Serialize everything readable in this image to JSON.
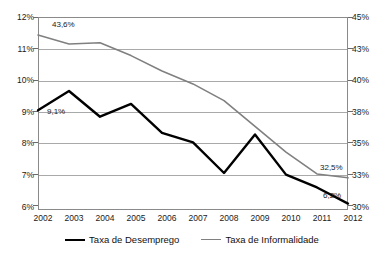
{
  "chart_data": {
    "type": "line",
    "title": "",
    "subtitle": "",
    "xlabel": "",
    "ylabel": "",
    "grid": true,
    "legend_position": "bottom",
    "categories": [
      "2002",
      "2003",
      "2004",
      "2005",
      "2006",
      "2007",
      "2008",
      "2009",
      "2010",
      "2011",
      "2012"
    ],
    "axes": {
      "left": {
        "name": "Taxa de Desemprego",
        "ticks": [
          "12%",
          "11%",
          "10%",
          "9%",
          "8%",
          "7%",
          "6%"
        ],
        "tick_values": [
          12,
          11,
          10,
          9,
          8,
          7,
          6
        ],
        "ylim": [
          6,
          12
        ],
        "unit": "%"
      },
      "right": {
        "name": "Taxa de Informalidade",
        "ticks": [
          "45%",
          "43%",
          "40%",
          "38%",
          "35%",
          "33%",
          "30%"
        ],
        "tick_values": [
          45,
          42.5,
          40,
          37.5,
          35,
          32.5,
          30
        ],
        "ylim": [
          30,
          45
        ],
        "unit": "%"
      }
    },
    "series": [
      {
        "name": "Taxa de Desemprego",
        "axis": "left",
        "color": "#000000",
        "line_width": 2.4,
        "values": [
          9.1,
          9.7,
          8.9,
          9.3,
          8.4,
          8.1,
          7.15,
          8.35,
          7.1,
          6.7,
          6.2
        ]
      },
      {
        "name": "Taxa de Informalidade",
        "axis": "right",
        "color": "#808080",
        "line_width": 1.6,
        "values": [
          43.6,
          42.9,
          43.0,
          42.0,
          40.8,
          39.8,
          38.5,
          36.5,
          34.5,
          32.8,
          32.5
        ]
      }
    ],
    "annotations": [
      {
        "text": "43,6%",
        "series": "Taxa de Informalidade",
        "category": "2002",
        "value": 43.6
      },
      {
        "text": "9,1%",
        "series": "Taxa de Desemprego",
        "category": "2002",
        "value": 9.1
      },
      {
        "text": "32,5%",
        "series": "Taxa de Informalidade",
        "category": "2012",
        "value": 32.5
      },
      {
        "text": "6,2%",
        "series": "Taxa de Desemprego",
        "category": "2012",
        "value": 6.2
      }
    ]
  },
  "legend": {
    "items": [
      {
        "label": "Taxa de Desemprego",
        "color": "#000000"
      },
      {
        "label": "Taxa de Informalidade",
        "color": "#808080"
      }
    ]
  },
  "colors": {
    "unemployment_line": "#000000",
    "informality_line": "#808080",
    "gridline": "#a9a9a9",
    "axis": "#8a8a8a",
    "text": "#1a1a1a",
    "background": "#ffffff"
  }
}
